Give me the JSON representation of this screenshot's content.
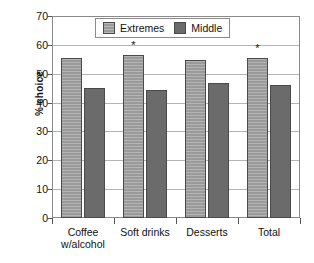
{
  "chart_data": {
    "type": "bar",
    "title": "",
    "xlabel": "",
    "ylabel": "% choice",
    "ylim": [
      0,
      70
    ],
    "yticks": [
      0,
      10,
      20,
      30,
      40,
      50,
      60,
      70
    ],
    "grid": true,
    "legend_position": "top-center",
    "categories": [
      "Coffee w/alcohol",
      "Soft drinks",
      "Desserts",
      "Total"
    ],
    "category_lines": [
      [
        "Coffee",
        "w/alcohol"
      ],
      [
        "Soft drinks",
        ""
      ],
      [
        "Desserts",
        ""
      ],
      [
        "Total",
        ""
      ]
    ],
    "series": [
      {
        "name": "Extremes",
        "color": "#9a9a9a",
        "values": [
          55.3,
          56.4,
          54.7,
          55.6
        ]
      },
      {
        "name": "Middle",
        "color": "#6b6b6b",
        "values": [
          45.0,
          44.4,
          46.7,
          46.2
        ]
      }
    ],
    "annotations": [
      {
        "category": "Soft drinks",
        "series": "Extremes",
        "text": "*"
      },
      {
        "category": "Total",
        "series": "Extremes",
        "text": "*"
      }
    ]
  },
  "axis": {
    "y_tick_labels": [
      "0",
      "10",
      "20",
      "30",
      "40",
      "50",
      "60",
      "70"
    ],
    "y_title": "% choice"
  },
  "legend": {
    "items": [
      {
        "label": "Extremes",
        "color": "#9a9a9a"
      },
      {
        "label": "Middle",
        "color": "#6b6b6b"
      }
    ]
  }
}
